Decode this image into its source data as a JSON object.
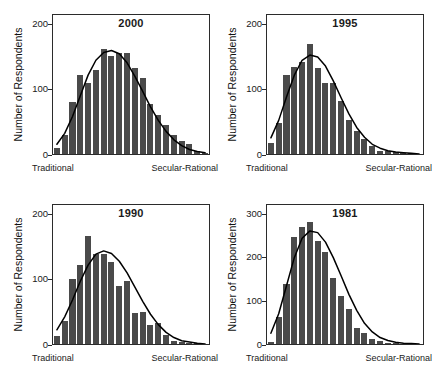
{
  "figure": {
    "ylabel": "Number of Respondents",
    "axis_caption": {
      "left": "Traditional",
      "right": "Secular-Rational"
    },
    "colors": {
      "bar": "#4a4a4a",
      "curve": "#000000",
      "frame": "#2b2b2b",
      "text": "#1a1a1a",
      "background": "#ffffff"
    }
  },
  "chart_data": [
    {
      "type": "bar",
      "title": "2000",
      "xlabel": "Traditional — Secular-Rational",
      "ylabel": "Number of Respondents",
      "ylim": [
        0,
        215
      ],
      "yticks": [
        0,
        100,
        200
      ],
      "ytick_labels": [
        "0",
        "100",
        "200"
      ],
      "grid": false,
      "legend": "none",
      "overlay": "normal curve",
      "categories": [
        "1",
        "2",
        "3",
        "4",
        "5",
        "6",
        "7",
        "8",
        "9",
        "10",
        "11",
        "12",
        "13",
        "14",
        "15",
        "16",
        "17",
        "18",
        "19",
        "20"
      ],
      "values": [
        10,
        30,
        80,
        122,
        110,
        130,
        163,
        152,
        157,
        157,
        133,
        117,
        78,
        60,
        45,
        30,
        20,
        15,
        5,
        2
      ],
      "curve": [
        15,
        32,
        58,
        90,
        122,
        145,
        157,
        160,
        155,
        141,
        120,
        97,
        73,
        52,
        35,
        22,
        13,
        7,
        4,
        2
      ]
    },
    {
      "type": "bar",
      "title": "1995",
      "xlabel": "Traditional — Secular-Rational",
      "ylabel": "Number of Respondents",
      "ylim": [
        0,
        215
      ],
      "yticks": [
        0,
        100,
        200
      ],
      "ytick_labels": [
        "0",
        "100",
        "200"
      ],
      "grid": false,
      "legend": "none",
      "overlay": "normal curve",
      "categories": [
        "1",
        "2",
        "3",
        "4",
        "5",
        "6",
        "7",
        "8",
        "9",
        "10",
        "11",
        "12",
        "13",
        "14",
        "15",
        "16",
        "17",
        "18",
        "19",
        "20"
      ],
      "values": [
        17,
        48,
        122,
        135,
        143,
        170,
        133,
        110,
        110,
        82,
        53,
        36,
        23,
        13,
        4,
        5,
        3,
        2,
        1,
        0
      ],
      "curve": [
        25,
        52,
        88,
        122,
        145,
        153,
        150,
        136,
        113,
        87,
        62,
        41,
        26,
        15,
        9,
        5,
        3,
        2,
        1,
        0
      ]
    },
    {
      "type": "bar",
      "title": "1990",
      "xlabel": "Traditional — Secular-Rational",
      "ylabel": "Number of Respondents",
      "ylim": [
        0,
        215
      ],
      "yticks": [
        0,
        100,
        200
      ],
      "ytick_labels": [
        "0",
        "100",
        "200"
      ],
      "grid": false,
      "legend": "none",
      "overlay": "normal curve",
      "categories": [
        "1",
        "2",
        "3",
        "4",
        "5",
        "6",
        "7",
        "8",
        "9",
        "10",
        "11",
        "12",
        "13",
        "14",
        "15",
        "16",
        "17",
        "18",
        "19",
        "20"
      ],
      "values": [
        12,
        35,
        101,
        122,
        167,
        140,
        140,
        127,
        90,
        98,
        48,
        50,
        30,
        32,
        14,
        5,
        3,
        2,
        1,
        0
      ],
      "curve": [
        22,
        42,
        68,
        97,
        122,
        139,
        144,
        140,
        128,
        110,
        88,
        66,
        46,
        30,
        18,
        10,
        5,
        3,
        1,
        0
      ]
    },
    {
      "type": "bar",
      "title": "1981",
      "xlabel": "Traditional — Secular-Rational",
      "ylabel": "Number of Respondents",
      "ylim": [
        0,
        322
      ],
      "yticks": [
        0,
        100,
        200,
        300
      ],
      "ytick_labels": [
        "0",
        "100",
        "200",
        "300"
      ],
      "grid": false,
      "legend": "none",
      "overlay": "normal curve",
      "categories": [
        "1",
        "2",
        "3",
        "4",
        "5",
        "6",
        "7",
        "8",
        "9",
        "10",
        "11",
        "12",
        "13",
        "14",
        "15",
        "16",
        "17",
        "18",
        "19",
        "20"
      ],
      "values": [
        5,
        62,
        140,
        248,
        272,
        282,
        238,
        213,
        152,
        112,
        80,
        37,
        25,
        12,
        6,
        3,
        2,
        1,
        0,
        0
      ],
      "curve": [
        25,
        70,
        135,
        200,
        245,
        262,
        258,
        236,
        200,
        158,
        115,
        78,
        48,
        28,
        15,
        8,
        4,
        2,
        1,
        0
      ]
    }
  ]
}
